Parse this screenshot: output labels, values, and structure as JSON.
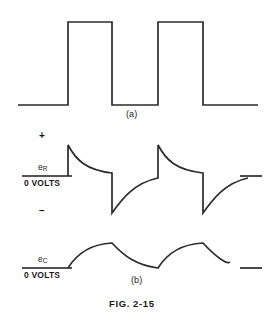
{
  "figure": {
    "caption": "FIG. 2-15",
    "panels": [
      {
        "id": "a",
        "label": "(a)",
        "title": "input square wave"
      },
      {
        "id": "b",
        "label": "(b)",
        "title": "resistor and capacitor voltages"
      }
    ]
  },
  "labels": {
    "plus_sign": "+",
    "minus_sign": "−",
    "zero_volts": "0 VOLTS",
    "e_r_symbol": "e",
    "e_r_subscript": "R",
    "e_c_symbol": "e",
    "e_c_subscript": "C"
  },
  "colors": {
    "trace": "#2b2b2b",
    "text": "#1a1a1a",
    "background": "#ffffff"
  },
  "chart_data": [
    {
      "type": "line",
      "title": "(a)",
      "name": "input-square-wave",
      "xlabel": "",
      "ylabel": "",
      "xlim": [
        0,
        278
      ],
      "ylim": [
        0,
        130
      ],
      "grid": false,
      "legend": "none",
      "baseline_y": 105,
      "high_y": 22,
      "points": [
        [
          18,
          105
        ],
        [
          68,
          105
        ],
        [
          68,
          22
        ],
        [
          112,
          22
        ],
        [
          112,
          105
        ],
        [
          158,
          105
        ],
        [
          158,
          22
        ],
        [
          203,
          22
        ],
        [
          203,
          105
        ],
        [
          258,
          105
        ]
      ]
    },
    {
      "type": "line",
      "title": "eR",
      "name": "resistor-voltage-waveform",
      "xlabel": "",
      "ylabel": "0 VOLTS",
      "xlim": [
        0,
        278
      ],
      "ylim": [
        130,
        235
      ],
      "grid": false,
      "legend": "none",
      "zero_line_y": 176,
      "peak_positive_y": 145,
      "peak_negative_y": 213,
      "description": "RC differentiator output: positive spike decaying exponentially toward zero, then negative spike decaying exponentially toward zero, repeated three times",
      "cycles": [
        {
          "rise_x": 68,
          "peak_y": 145,
          "decay_end_x": 112,
          "decay_end_y": 173,
          "fall_x": 112,
          "trough_y": 213,
          "recover_end_x": 158,
          "recover_end_y": 178
        },
        {
          "rise_x": 158,
          "peak_y": 145,
          "decay_end_x": 203,
          "decay_end_y": 173,
          "fall_x": 203,
          "trough_y": 213,
          "recover_end_x": 248,
          "recover_end_y": 178
        }
      ],
      "reference_tick": {
        "x1": 240,
        "x2": 262,
        "y": 176
      }
    },
    {
      "type": "line",
      "title": "eC",
      "name": "capacitor-voltage-waveform",
      "xlabel": "(b)",
      "ylabel": "0 VOLTS",
      "xlim": [
        0,
        278
      ],
      "ylim": [
        230,
        290
      ],
      "grid": false,
      "legend": "none",
      "zero_line_y": 268,
      "peak_y": 243,
      "description": "RC integrator output: exponential charge toward peak during input high, exponential discharge toward zero during input low, repeated three times",
      "cycles": [
        {
          "charge_start_x": 68,
          "charge_end_x": 112,
          "peak_y": 243,
          "discharge_end_x": 158,
          "discharge_end_y": 268
        },
        {
          "charge_start_x": 158,
          "charge_end_x": 203,
          "peak_y": 243,
          "discharge_end_x": 230,
          "discharge_end_y": 262
        }
      ],
      "reference_tick": {
        "x1": 240,
        "x2": 262,
        "y": 268
      }
    }
  ]
}
